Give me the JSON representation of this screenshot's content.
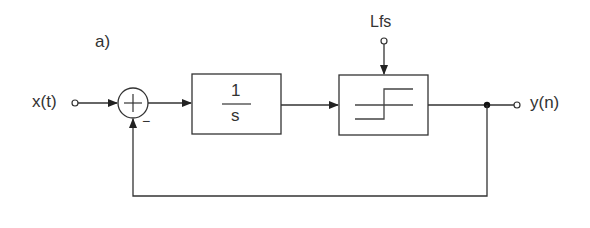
{
  "diagram": {
    "panel_label": "a)",
    "input_label": "x(t)",
    "output_label": "y(n)",
    "sum_sign_feedback": "−",
    "integrator": {
      "numerator": "1",
      "denominator": "s"
    },
    "quantizer": {
      "control_label": "Lfs",
      "symbol": "step-quantizer"
    },
    "colors": {
      "line": "#333333",
      "background": "#ffffff"
    }
  }
}
